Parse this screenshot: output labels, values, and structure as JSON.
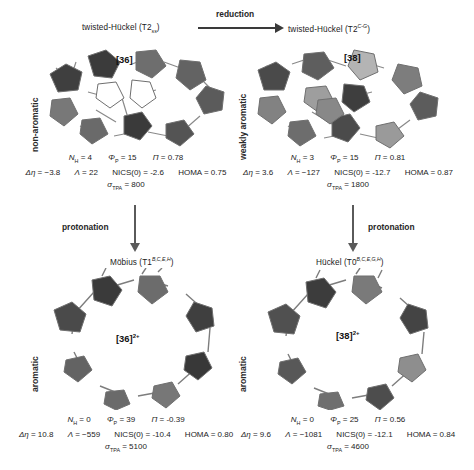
{
  "figure": {
    "side_labels": {
      "top_left": "non-aromatic",
      "top_right": "weakly aromatic",
      "bottom_left": "aromatic",
      "bottom_right": "aromatic"
    },
    "reactions": {
      "reduction": "reduction",
      "protonation_left": "protonation",
      "protonation_right": "protonation"
    }
  },
  "panels": [
    {
      "id": "top-left",
      "title_main": "twisted-Hückel (",
      "title_sym": "T2",
      "title_affix": "ss",
      "title_affix_kind": "sub",
      "title_close": ")",
      "tag": "[36]",
      "charge": "",
      "data": {
        "NH_label": "N",
        "NH_sub": "H",
        "NH_value": "= 4",
        "PHI_label": "Φ",
        "PHI_sub": "P",
        "PHI_value": "= 15",
        "PI_label": "Π",
        "PI_value": "= 0.78",
        "DELTA_label": "Δη",
        "DELTA_value": "= −3.8",
        "LAMBDA_label": "Λ",
        "LAMBDA_value": "= 22",
        "NICS_label": "NICS(0)",
        "NICS_value": "= -2.6",
        "HOMA_label": "HOMA",
        "HOMA_value": "= 0.75",
        "SIGMA_label": "σ",
        "SIGMA_sub": "TPA",
        "SIGMA_value": "= 800"
      }
    },
    {
      "id": "top-right",
      "title_main": "twisted-Hückel (",
      "title_sym": "T2",
      "title_affix": "C-G",
      "title_affix_kind": "sup",
      "title_close": ")",
      "tag": "[38]",
      "charge": "",
      "data": {
        "NH_label": "N",
        "NH_sub": "H",
        "NH_value": "= 3",
        "PHI_label": "Φ",
        "PHI_sub": "P",
        "PHI_value": "= 15",
        "PI_label": "Π",
        "PI_value": "= 0.81",
        "DELTA_label": "Δη",
        "DELTA_value": "= 3.6",
        "LAMBDA_label": "Λ",
        "LAMBDA_value": "= −127",
        "NICS_label": "NICS(0)",
        "NICS_value": "= -12.7",
        "HOMA_label": "HOMA",
        "HOMA_value": "= 0.87",
        "SIGMA_label": "σ",
        "SIGMA_sub": "TPA",
        "SIGMA_value": "= 1800"
      }
    },
    {
      "id": "bottom-left",
      "title_main": "Möbius (",
      "title_sym": "T1",
      "title_affix": "B,C,E,H",
      "title_affix_kind": "sup",
      "title_close": ")",
      "tag": "[36]",
      "charge": "2+",
      "data": {
        "NH_label": "N",
        "NH_sub": "H",
        "NH_value": "= 0",
        "PHI_label": "Φ",
        "PHI_sub": "P",
        "PHI_value": "= 39",
        "PI_label": "Π",
        "PI_value": "= -0.39",
        "DELTA_label": "Δη",
        "DELTA_value": "= 10.8",
        "LAMBDA_label": "Λ",
        "LAMBDA_value": "= −559",
        "NICS_label": "NICS(0)",
        "NICS_value": "= -10.4",
        "HOMA_label": "HOMA",
        "HOMA_value": "= 0.80",
        "SIGMA_label": "σ",
        "SIGMA_sub": "TPA",
        "SIGMA_value": "= 5100"
      }
    },
    {
      "id": "bottom-right",
      "title_main": "Hückel (",
      "title_sym": "T0",
      "title_affix": "B,C,E,G,H",
      "title_affix_kind": "sup",
      "title_close": ")",
      "tag": "[38]",
      "charge": "2+",
      "data": {
        "NH_label": "N",
        "NH_sub": "H",
        "NH_value": "= 0",
        "PHI_label": "Φ",
        "PHI_sub": "P",
        "PHI_value": "= 25",
        "PI_label": "Π",
        "PI_value": "= 0.56",
        "DELTA_label": "Δη",
        "DELTA_value": "= 9.6",
        "LAMBDA_label": "Λ",
        "LAMBDA_value": "= −1081",
        "NICS_label": "NICS(0)",
        "NICS_value": "= -12.1",
        "HOMA_label": "HOMA",
        "HOMA_value": "= 0.84",
        "SIGMA_label": "σ",
        "SIGMA_sub": "TPA",
        "SIGMA_value": "= 4600"
      }
    }
  ],
  "colors": {
    "ring_dark": "#3f3f3f",
    "ring_mid": "#6e6e6e",
    "ring_light": "#a8a8a8",
    "ring_pale": "#cfcfcf",
    "bond": "#8a8a8a",
    "arrow": "#3a3a3a"
  }
}
